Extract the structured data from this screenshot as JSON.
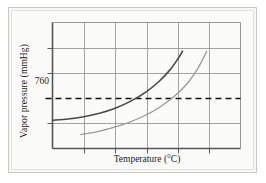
{
  "chart_data": {
    "type": "line",
    "title": "",
    "xlabel": "Temperature (°C)",
    "ylabel": "Vapor pressure (mmHg)",
    "xtick_labels": [],
    "ytick_labels": [
      "760"
    ],
    "grid": true,
    "legend": false,
    "reference_lines": [
      {
        "name": "standard-atmospheric-pressure",
        "axis": "y",
        "value": 760,
        "label": "760",
        "style": "dashed",
        "color": "#111111"
      }
    ],
    "xlim": [
      0,
      6
    ],
    "ylim": [
      0,
      5
    ],
    "x_gridlines": [
      1,
      2,
      3,
      4,
      5
    ],
    "y_gridlines": [
      1,
      3,
      4
    ],
    "series": [
      {
        "name": "volatile-liquid-curve",
        "label": "",
        "color": "#4a4a4a",
        "width": 1.6,
        "points": [
          [
            0.0,
            1.12
          ],
          [
            0.5,
            1.17
          ],
          [
            1.0,
            1.26
          ],
          [
            1.5,
            1.4
          ],
          [
            2.0,
            1.6
          ],
          [
            2.5,
            1.88
          ],
          [
            3.0,
            2.26
          ],
          [
            3.4,
            2.66
          ],
          [
            3.75,
            3.12
          ],
          [
            4.0,
            3.55
          ],
          [
            4.15,
            3.86
          ]
        ]
      },
      {
        "name": "less-volatile-liquid-curve",
        "label": "",
        "color": "#9a9a9a",
        "width": 1.3,
        "points": [
          [
            0.9,
            0.55
          ],
          [
            1.4,
            0.66
          ],
          [
            1.9,
            0.82
          ],
          [
            2.4,
            1.02
          ],
          [
            2.9,
            1.28
          ],
          [
            3.4,
            1.62
          ],
          [
            3.9,
            2.08
          ],
          [
            4.3,
            2.58
          ],
          [
            4.6,
            3.1
          ],
          [
            4.8,
            3.55
          ],
          [
            4.92,
            3.86
          ]
        ]
      }
    ]
  },
  "figure": {
    "caption": ""
  }
}
